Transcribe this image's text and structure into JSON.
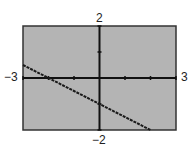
{
  "chart_data": {
    "type": "line",
    "title": "",
    "xlabel": "",
    "ylabel": "",
    "xlim": [
      -3,
      3
    ],
    "ylim": [
      -2,
      2
    ],
    "x_tick_step": 1,
    "y_tick_step": 1,
    "grid": false,
    "series": [
      {
        "name": "y = -0.5x - 1",
        "x": [
          -3,
          -2,
          -1,
          0,
          1,
          2
        ],
        "values": [
          0.5,
          0,
          -0.5,
          -1,
          -1.5,
          -2
        ]
      }
    ],
    "window_labels": {
      "xmin": "−3",
      "xmax": "3",
      "ymin": "−2",
      "ymax": "2"
    }
  },
  "colors": {
    "plot_background": "#b4b4b4",
    "axis": "#111111",
    "line": "#1a1a1a",
    "frame": "#333333"
  }
}
